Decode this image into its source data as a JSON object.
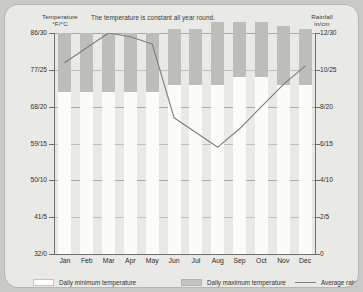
{
  "chart_data": {
    "type": "bar",
    "title": "The temperature is constant all year round.",
    "categories": [
      "Jan",
      "Feb",
      "Mar",
      "Apr",
      "May",
      "Jun",
      "Jul",
      "Aug",
      "Sep",
      "Oct",
      "Nov",
      "Dec"
    ],
    "left_axis": {
      "label": "Temperature\n°F/°C",
      "label_line1": "Temperature",
      "label_line2": "°F/°C",
      "ticks": [
        "86/30",
        "77/25",
        "68/20",
        "59/15",
        "50/10",
        "41/5",
        "32/0"
      ],
      "tick_values_c": [
        30,
        25,
        20,
        15,
        10,
        5,
        0
      ],
      "range_c": [
        0,
        30
      ]
    },
    "right_axis": {
      "label_line1": "Rainfall",
      "label_line2": "in/cm",
      "ticks": [
        "12/30",
        "10/25",
        "8/20",
        "6/15",
        "4/10",
        "2/5",
        "0"
      ],
      "tick_values_cm": [
        30,
        25,
        20,
        15,
        10,
        5,
        0
      ],
      "range_cm": [
        0,
        30
      ]
    },
    "grid": true,
    "legend_position": "bottom",
    "series": [
      {
        "name": "Daily minimum temperature",
        "type": "bar",
        "color": "#fbfbfa",
        "axis": "left",
        "unit": "C",
        "values": [
          22,
          22,
          22,
          22,
          22,
          23,
          23,
          23,
          24,
          24,
          23,
          23
        ]
      },
      {
        "name": "Daily maximum temperature",
        "type": "bar",
        "color": "#bdbdba",
        "axis": "left",
        "unit": "C",
        "values": [
          30,
          30,
          30,
          30,
          30,
          30.5,
          30.5,
          31.5,
          31.5,
          31.5,
          31,
          30.5
        ]
      },
      {
        "name": "Average rainfall",
        "type": "line",
        "color": "#7d7d7b",
        "axis": "right",
        "unit": "cm",
        "values": [
          26.0,
          28.0,
          30.0,
          29.5,
          28.5,
          18.5,
          16.5,
          14.5,
          17.0,
          20.0,
          23.0,
          25.5
        ]
      }
    ]
  },
  "legend": {
    "items": [
      {
        "label": "Daily minimum temperature",
        "swatch": "min-swatch"
      },
      {
        "label": "Daily maximum temperature",
        "swatch": "max-swatch"
      },
      {
        "label": "Average rainfall",
        "swatch": "line-swatch"
      }
    ]
  },
  "colors": {
    "card_bg": "#e9e9e6",
    "bar_max": "#bdbdba",
    "bar_min": "#fbfbfa",
    "line": "#7d7d7b",
    "grid": "#a9a9a7",
    "axis": "#6e6e6c"
  }
}
